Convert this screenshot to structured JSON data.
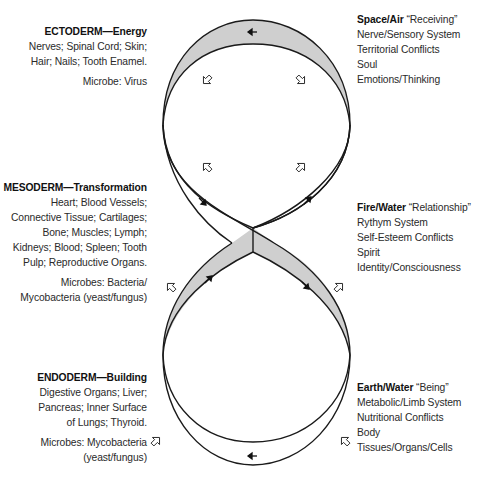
{
  "left": {
    "ectoderm": {
      "title": "ECTODERM—Energy",
      "lines": [
        "Nerves; Spinal Cord; Skin;",
        "Hair; Nails; Tooth Enamel."
      ],
      "microbe": "Microbe: Virus"
    },
    "mesoderm": {
      "title": "MESODERM—Transformation",
      "lines": [
        "Heart; Blood Vessels;",
        "Connective Tissue; Cartilages;",
        "Bone; Muscles; Lymph;",
        "Kidneys; Blood; Spleen; Tooth",
        "Pulp; Reproductive Organs."
      ],
      "microbes": [
        "Microbes: Bacteria/",
        "Mycobacteria (yeast/fungus)"
      ]
    },
    "endoderm": {
      "title": "ENDODERM—Building",
      "lines": [
        "Digestive Organs; Liver;",
        "Pancreas; Inner Surface",
        "of Lungs; Thyroid."
      ],
      "microbes": [
        "Microbes: Mycobacteria",
        "(yeast/fungus)"
      ]
    }
  },
  "right": {
    "space_air": {
      "title": "Space/Air",
      "subtitle": "“Receiving”",
      "lines": [
        "Nerve/Sensory System",
        "Territorial Conflicts",
        "Soul",
        "Emotions/Thinking"
      ]
    },
    "fire_water": {
      "title": "Fire/Water",
      "subtitle": "“Relationship”",
      "lines": [
        "Rythym System",
        "Self-Esteem Conflicts",
        "Spirit",
        "Identity/Consciousness"
      ]
    },
    "earth_water": {
      "title": "Earth/Water",
      "subtitle": "“Being”",
      "lines": [
        "Metabolic/Limb System",
        "Nutritional Conflicts",
        "Body",
        "Tissues/Organs/Cells"
      ]
    }
  },
  "diagram": {
    "shape": "figure-eight band",
    "shade_color": "#cfcfcf",
    "stroke_color": "#1a1a1a",
    "flow_arrows": [
      "left-arrow-top",
      "down-right-arrow-left",
      "up-right-arrow-right",
      "up-right-arrow-lower-left",
      "down-right-arrow-lower-right",
      "left-arrow-bottom"
    ],
    "outline_arrows": 8
  }
}
